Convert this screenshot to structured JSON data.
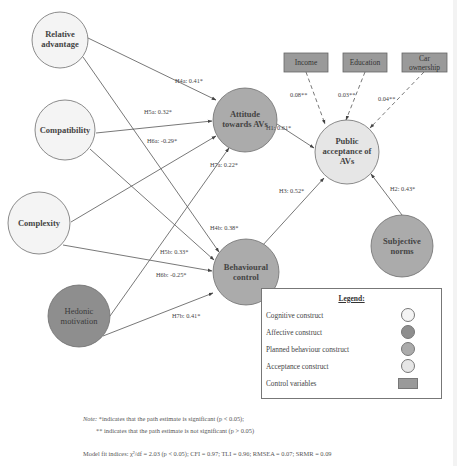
{
  "colors": {
    "cognitive": "#f4f4f4",
    "affective": "#8e8e8e",
    "planned_behaviour": "#ababab",
    "acceptance": "#e6e6e6",
    "control": "#9a9a9a",
    "stroke": "#6e6e6e",
    "edge": "#555555"
  },
  "nodes": {
    "relative_advantage": {
      "line1": "Relative",
      "line2": "advantage",
      "type": "cognitive"
    },
    "compatibility": {
      "line1": "Compatibility",
      "type": "cognitive"
    },
    "complexity": {
      "line1": "Complexity",
      "type": "cognitive"
    },
    "hedonic_motivation": {
      "line1": "Hedonic",
      "line2": "motivation",
      "type": "affective"
    },
    "attitude": {
      "line1": "Attitude",
      "line2": "towards AVs",
      "type": "planned_behaviour"
    },
    "behavioural_control": {
      "line1": "Behavioural",
      "line2": "control",
      "type": "planned_behaviour"
    },
    "public_acceptance": {
      "line1": "Public",
      "line2": "acceptance of",
      "line3": "AVs",
      "type": "acceptance"
    },
    "subjective_norms": {
      "line1": "Subjective",
      "line2": "norms",
      "type": "planned_behaviour"
    }
  },
  "controls": {
    "income": {
      "line1": "Income"
    },
    "education": {
      "line1": "Education"
    },
    "car_ownership": {
      "line1": "Car",
      "line2": "ownership"
    }
  },
  "paths": {
    "h4a": "H4a: 0.41*",
    "h5a": "H5a: 0.32*",
    "h6a": "H6a: -0.29*",
    "h7a": "H7a: 0.22*",
    "h1": "H1: 0.61*",
    "h3": "H3: 0.52*",
    "h2": "H2: 0.43*",
    "h4b": "H4b: 0.38*",
    "h5b": "H5b: 0.33*",
    "h6b": "H6b: -0.25*",
    "h7b": "H7b: 0.41*",
    "income": "0.08**",
    "education": "0.03**",
    "car_ownership": "0.04**"
  },
  "legend": {
    "title": "Legend:",
    "items": [
      {
        "label": "Cognitive construct",
        "shape": "circle"
      },
      {
        "label": "Affective construct",
        "shape": "circle"
      },
      {
        "label": "Planned behaviour construct",
        "shape": "circle"
      },
      {
        "label": "Acceptance construct",
        "shape": "circle"
      },
      {
        "label": "Control variables",
        "shape": "rect"
      }
    ]
  },
  "notes": {
    "note_prefix": "Note:",
    "note_line1": " *indicates that the path estimate is significant (p < 0.05);",
    "note_line2": "** indicates that the path estimate is not significant (p > 0.05)",
    "model_fit": "Model fit indices: χ²/df = 2.03 (p < 0.05); CFI = 0.97; TLI = 0.96; RMSEA = 0.07; SRMR = 0.09"
  }
}
